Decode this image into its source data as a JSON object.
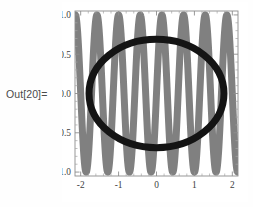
{
  "cell": {
    "out_label": "Out[20]="
  },
  "chart_data": {
    "type": "line",
    "title": "",
    "xlabel": "",
    "ylabel": "",
    "xlim": [
      -2.15,
      2.15
    ],
    "ylim": [
      -1.05,
      1.05
    ],
    "grid": false,
    "legend": "none",
    "background": "#ffffff",
    "frame": true,
    "xticks": [
      -2,
      -1,
      0,
      1,
      2
    ],
    "xtick_labels": [
      "-2",
      "-1",
      "0",
      "1",
      "2"
    ],
    "yticks": [
      -1.0,
      -0.5,
      0.0,
      0.5,
      1.0
    ],
    "ytick_labels": [
      "-1.0",
      "-0.5",
      "0.0",
      "0.5",
      "1.0"
    ],
    "xminor_step": 0.2,
    "yminor_step": 0.1,
    "series": [
      {
        "name": "high-frequency-sine",
        "color": "#808080",
        "thickness": 7,
        "kind": "sine",
        "amplitude": 1.0,
        "frequency": 11.0,
        "phase": 0.0,
        "description": "Thick gray rapidly oscillating sine wave spanning full vertical range, about 7 cycles across x from -2 to 2"
      },
      {
        "name": "circle-curve",
        "color": "#141414",
        "thickness": 7,
        "kind": "ellipse",
        "center": [
          0.0,
          0.0
        ],
        "radius_x": 1.78,
        "radius_y": 0.69,
        "description": "Thick black closed elliptical ring centered at origin"
      }
    ]
  }
}
